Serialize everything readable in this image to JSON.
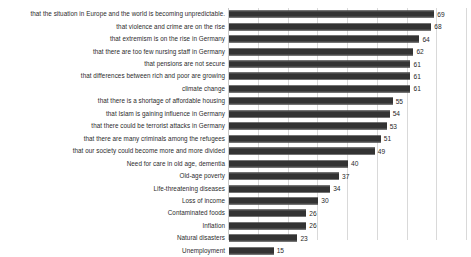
{
  "chart_data": {
    "type": "bar",
    "orientation": "horizontal",
    "title": "",
    "subtitle": "",
    "xlabel": "",
    "ylabel": "",
    "xlim": [
      0,
      80
    ],
    "grid": true,
    "gridline_values": [
      0,
      10,
      20,
      30,
      40,
      50,
      60,
      70,
      80
    ],
    "legend": "none",
    "categories": [
      "that the situation in Europe and the world is becoming unpredictable.",
      "that violence and crime are on the rise",
      "that extremism is on the rise in Germany",
      "that there are too few nursing staff in Germany",
      "that pensions are not secure",
      "that differences between rich and poor are growing",
      "climate change",
      "that there is a shortage of affordable housing",
      "that Islam is gaining influence in Germany",
      "that there could be terrorist attacks in Germany",
      "that there are many criminals among the refugees",
      "that our society could become more and more divided",
      "Need for care in old age, dementia",
      "Old-age poverty",
      "Life-threatening diseases",
      "Loss of income",
      "Contaminated foods",
      "Inflation",
      "Natural disasters",
      "Unemployment"
    ],
    "values": [
      69,
      68,
      64,
      62,
      61,
      61,
      61,
      55,
      54,
      53,
      51,
      49,
      40,
      37,
      34,
      30,
      26,
      26,
      23,
      15
    ],
    "value_labels": [
      "69",
      "68",
      "64",
      "62",
      "61",
      "61",
      "61",
      "55",
      "54",
      "53",
      "51",
      "49",
      "40",
      "37",
      "34",
      "30",
      "26",
      "26",
      "23",
      "15"
    ],
    "bar_color": "#3a3a3a",
    "gridline_color": "#d9d9d9",
    "background_color": "#ffffff",
    "text_color": "#2b2b2b"
  }
}
